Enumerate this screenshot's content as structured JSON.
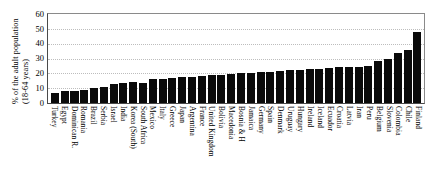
{
  "chart_data": {
    "type": "bar",
    "title": "",
    "subtitle": "",
    "xlabel": "",
    "ylabel_line1": "% of the adult population",
    "ylabel_line2": "(18-64 years)",
    "ylim": [
      0,
      60
    ],
    "yticks": [
      0,
      10,
      20,
      30,
      40,
      50,
      60
    ],
    "grid": true,
    "legend": "none",
    "bar_color": "#0a0a0a",
    "categories": [
      "Turkey",
      "Egypt",
      "Dominican R.",
      "Romania",
      "Brazil",
      "Serbia",
      "Israel",
      "India",
      "Korea (South)",
      "South Africa",
      "Mexico",
      "Italy",
      "Greece",
      "Japan",
      "Argentina",
      "France",
      "United Kingdom",
      "Bolivia",
      "Macedonia",
      "Bosnia & H",
      "Jamaica",
      "Germany",
      "Spain",
      "Denmark",
      "Uruguay",
      "Hungary",
      "Ireland",
      "Iceland",
      "Ecuador",
      "Croatia",
      "Latvia",
      "Iran",
      "Peru",
      "Belgium",
      "Slovenia",
      "Colombia",
      "Chile",
      "Finland"
    ],
    "values": [
      7,
      8,
      8,
      9,
      10,
      10.5,
      13,
      13.5,
      14,
      13.5,
      16.5,
      16.5,
      17,
      17.5,
      17.5,
      18,
      19,
      19,
      19.5,
      20,
      20.5,
      21,
      21,
      21.5,
      22,
      22.5,
      23,
      23,
      23.5,
      24,
      24,
      24.5,
      25,
      28,
      30,
      34,
      36,
      48
    ]
  }
}
